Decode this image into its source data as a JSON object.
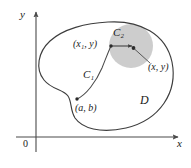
{
  "figure": {
    "axes": {
      "y_label": "y",
      "x_label": "x",
      "origin_label": "0"
    },
    "labels": {
      "point_x1_y": "(x₁, y)",
      "point_x_y": "(x, y)",
      "point_a_b": "(a, b)",
      "curve_c1": "C₁",
      "curve_c2": "C₂",
      "region_d": "D"
    },
    "colors": {
      "stroke": "#3d3d3d",
      "axis": "#4a4a4a",
      "disk_fill": "#c9c9c9",
      "text": "#1a1a1a",
      "background": "#ffffff"
    },
    "geometry": {
      "origin": [
        36,
        137
      ],
      "disk_center": [
        131,
        46
      ],
      "disk_radius": 22,
      "point_x1_y": [
        111,
        46
      ],
      "point_x_y": [
        134,
        50
      ],
      "point_a_b": [
        77,
        99
      ]
    }
  }
}
